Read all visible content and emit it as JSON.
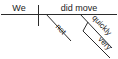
{
  "diagram": {
    "type": "sentence-diagram",
    "style": "reed-kellogg",
    "sentence": "We did not move very quickly.",
    "baseline": {
      "name": "main-baseline",
      "x1": 1,
      "y1": 14,
      "x2": 117,
      "y2": 14
    },
    "subject_divider": {
      "name": "subject-predicate-divider",
      "x1": 38,
      "y1": 5,
      "x2": 38,
      "y2": 26
    },
    "nodes": [
      {
        "id": "subject",
        "label": "We",
        "role": "subject",
        "x": 19,
        "y": 11,
        "anchor": "middle",
        "size": 9
      },
      {
        "id": "verb",
        "label": "did move",
        "role": "verb-phrase",
        "x": 79,
        "y": 11,
        "anchor": "middle",
        "size": 9
      },
      {
        "id": "adverb-not",
        "label": "not",
        "role": "adverb-modifier",
        "x": 59,
        "y": 31,
        "rotate": 47,
        "anchor": "middle",
        "size": 8
      },
      {
        "id": "adverb-quickly",
        "label": "quickly",
        "role": "adverb-modifier",
        "x": 100,
        "y": 27,
        "rotate": 47,
        "anchor": "middle",
        "size": 8
      },
      {
        "id": "adverb-very",
        "label": "very",
        "role": "adverb-of-adverb",
        "x": 103,
        "y": 45,
        "rotate": 47,
        "anchor": "middle",
        "size": 8
      }
    ],
    "edges": [
      {
        "id": "not-slant",
        "from": "verb",
        "to": "adverb-not",
        "x1": 46,
        "y1": 14,
        "x2": 71,
        "y2": 41
      },
      {
        "id": "quickly-slant",
        "from": "verb",
        "to": "adverb-quickly",
        "x1": 80,
        "y1": 14,
        "x2": 112,
        "y2": 48
      },
      {
        "id": "very-connector",
        "from": "adverb-quickly",
        "to": "very-slant",
        "x1": 88,
        "y1": 22,
        "x2": 83,
        "y2": 31
      },
      {
        "id": "very-slant",
        "from": "very-connector",
        "to": "adverb-very",
        "x1": 83,
        "y1": 31,
        "x2": 110,
        "y2": 58
      }
    ],
    "colors": {
      "line": "#2b2b2b",
      "text": "#1a1a1a",
      "background": "#ffffff"
    }
  }
}
